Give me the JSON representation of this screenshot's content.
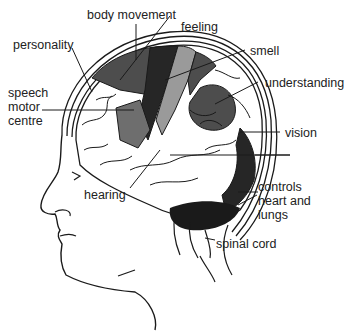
{
  "diagram": {
    "labels": {
      "body_movement": "body movement",
      "feeling": "feeling",
      "personality": "personality",
      "smell": "smell",
      "understanding": "understanding",
      "speech_motor_centre": [
        "speech",
        "motor",
        "centre"
      ],
      "vision": "vision",
      "hearing": "hearing",
      "controls_heart_lungs": [
        "controls",
        "heart and",
        "lungs"
      ],
      "spinal_cord": "spinal cord"
    },
    "colors": {
      "background": "#ffffff",
      "outline": "#1a1a1a",
      "dark_region": "#262626",
      "mid_dark_region": "#4d4d4d",
      "mid_region": "#6e6e6e",
      "light_region": "#9a9a9a",
      "white_region": "#ffffff"
    }
  }
}
